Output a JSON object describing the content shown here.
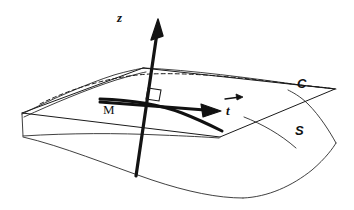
{
  "figure": {
    "background_color": "#ffffff",
    "stroke_color": "#111111",
    "width": 354,
    "height": 210,
    "labels": {
      "z_axis": "z",
      "point": "M",
      "tangent_vector": "t",
      "curve": "C",
      "surface": "S"
    },
    "elements": {
      "z_axis_name": "vertical-normal-axis",
      "surface_name": "saddle-surface",
      "plane_name": "tangent-plane",
      "curve_name": "surface-curve-dashed",
      "bold_curve_name": "curve-through-point",
      "vector_name": "tangent-vector-arrow",
      "right_angle_name": "right-angle-marker"
    },
    "geometry": {
      "z_axis": {
        "x1": 136,
        "y1": 176,
        "x2": 160,
        "y2": 22
      },
      "point_M": {
        "x": 143,
        "y": 104
      },
      "plane_corners": [
        {
          "x": 22,
          "y": 113
        },
        {
          "x": 143,
          "y": 68
        },
        {
          "x": 335,
          "y": 89
        },
        {
          "x": 220,
          "y": 137
        }
      ],
      "tangent_arrow": {
        "x1": 100,
        "y1": 100,
        "x2": 218,
        "y2": 110
      },
      "curve_dashed_endpoints": [
        {
          "x": 40,
          "y": 104
        },
        {
          "x": 332,
          "y": 89
        }
      ],
      "surface_low_point": {
        "x": 243,
        "y": 198
      }
    }
  }
}
